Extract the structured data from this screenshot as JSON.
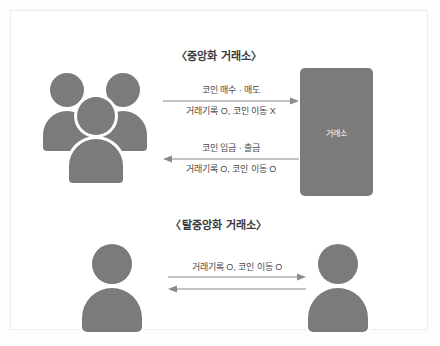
{
  "diagram": {
    "sections": [
      {
        "id": "centralized",
        "title": "〈중앙화 거래소〉",
        "actor_left": "group-of-users",
        "actor_right_label": "거래소",
        "flows": [
          {
            "id": "buy-sell",
            "direction": "right",
            "label_above": "코인 매수 · 매도",
            "label_below": "거래기록 O, 코인 이동 X"
          },
          {
            "id": "deposit-withdraw",
            "direction": "left",
            "label_above": "코인 입금 · 출금",
            "label_below": "거래기록 O, 코인 이동 O"
          }
        ]
      },
      {
        "id": "decentralized",
        "title": "〈탈중앙화 거래소〉",
        "actor_left": "single-user",
        "actor_right": "single-user",
        "flows": [
          {
            "id": "peer-to-peer",
            "direction": "bidirectional",
            "label_above": "거래기록 O, 코인 이동 O"
          }
        ]
      }
    ],
    "colors": {
      "figure_gray": "#7b7b7b",
      "text_dark": "#3a3a3a",
      "text_body": "#4a4a4a",
      "arrow_gray": "#8a8a8a",
      "frame_border": "#ececec",
      "background": "#ffffff"
    }
  }
}
